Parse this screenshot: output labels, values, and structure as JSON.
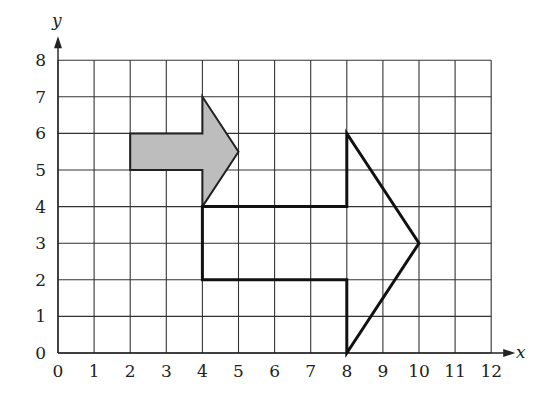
{
  "diagram": {
    "type": "coordinate-grid-transformation",
    "axes": {
      "x": {
        "label": "x",
        "min": 0,
        "max": 12,
        "ticks": [
          "0",
          "1",
          "2",
          "3",
          "4",
          "5",
          "6",
          "7",
          "8",
          "9",
          "10",
          "11",
          "12"
        ]
      },
      "y": {
        "label": "y",
        "min": 0,
        "max": 8,
        "ticks": [
          "0",
          "1",
          "2",
          "3",
          "4",
          "5",
          "6",
          "7",
          "8"
        ]
      }
    },
    "shapes": [
      {
        "name": "small-shaded-arrow",
        "fill": "#bdbdbd",
        "stroke": "#222222",
        "points": [
          [
            2,
            5
          ],
          [
            2,
            6
          ],
          [
            4,
            6
          ],
          [
            4,
            7
          ],
          [
            5,
            5.5
          ],
          [
            4,
            4
          ],
          [
            4,
            5
          ]
        ]
      },
      {
        "name": "large-outlined-arrow",
        "fill": "none",
        "stroke": "#111111",
        "points": [
          [
            4,
            2
          ],
          [
            4,
            4
          ],
          [
            8,
            4
          ],
          [
            8,
            6
          ],
          [
            10,
            3
          ],
          [
            8,
            0
          ],
          [
            8,
            2
          ]
        ]
      }
    ]
  },
  "colors": {
    "grid": "#333333",
    "shaded_fill": "#bdbdbd",
    "outline": "#111111"
  }
}
